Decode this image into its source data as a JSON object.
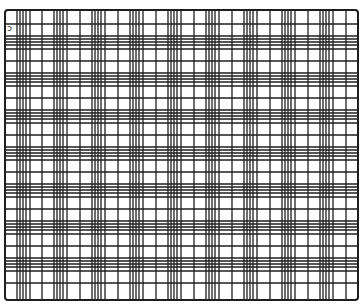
{
  "figure": {
    "width": 363,
    "height": 305,
    "frame": {
      "left": 5,
      "top": 10,
      "right": 358,
      "bottom": 300
    },
    "line_color": "#1e1e1e",
    "background_color": "#ffffff",
    "border_width": 2,
    "line_width": 1.3,
    "vertical_lines_x": [
      17,
      20,
      23,
      26,
      30,
      42,
      54,
      57,
      60,
      63,
      67,
      80,
      92,
      95,
      98,
      101,
      105,
      118,
      130,
      133,
      136,
      139,
      143,
      156,
      168,
      171,
      174,
      177,
      181,
      194,
      206,
      209,
      212,
      215,
      219,
      232,
      244,
      247,
      250,
      253,
      257,
      270,
      282,
      285,
      288,
      291,
      295,
      308,
      320,
      323,
      326,
      329,
      333,
      346
    ],
    "horizontal_lines_y": [
      24,
      36,
      39,
      42,
      45,
      49,
      61,
      73,
      76,
      79,
      82,
      86,
      98,
      110,
      113,
      116,
      119,
      123,
      135,
      147,
      150,
      153,
      156,
      160,
      172,
      184,
      187,
      190,
      193,
      197,
      209,
      221,
      224,
      227,
      230,
      234,
      246,
      258,
      261,
      264,
      267,
      271,
      283
    ],
    "corner_mark": "ↄ"
  }
}
